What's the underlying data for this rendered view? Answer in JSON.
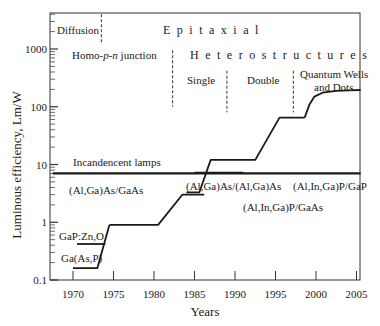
{
  "chart_data": {
    "type": "line",
    "title": "",
    "xlabel": "Years",
    "ylabel": "Luminous efficiency, Lm/W",
    "xlim": [
      1967,
      2006
    ],
    "ylim": [
      0.1,
      4000
    ],
    "yscale": "log",
    "grid": false,
    "x_ticks": [
      1970,
      1975,
      1980,
      1985,
      1990,
      1995,
      2000,
      2005
    ],
    "y_ticks": [
      0.1,
      1,
      10,
      100,
      1000
    ],
    "y_tick_labels": [
      "0.1",
      "1",
      "10",
      "100",
      "1000"
    ],
    "series": [
      {
        "name": "Ga(As,P)",
        "points": [
          [
            1970,
            0.16
          ],
          [
            1973,
            0.16
          ],
          [
            1974.5,
            0.9
          ]
        ]
      },
      {
        "name": "GaP:Zn,O",
        "points": [
          [
            1970.5,
            0.42
          ],
          [
            1974,
            0.42
          ]
        ]
      },
      {
        "name": "(Al,Ga)As/GaAs",
        "points": [
          [
            1974.5,
            0.9
          ],
          [
            1980.5,
            0.9
          ],
          [
            1983.5,
            3.0
          ],
          [
            1986.2,
            3.0
          ]
        ]
      },
      {
        "name": "(Al,Ga)As/(Al,Ga)As",
        "points": [
          [
            1984,
            3.3
          ],
          [
            1985.6,
            3.3
          ],
          [
            1987,
            12
          ],
          [
            1992.5,
            12
          ],
          [
            1995.5,
            65
          ],
          [
            1998.6,
            65
          ]
        ]
      },
      {
        "name": "(Al,In,Ga)P/GaAs & (Al,In,Ga)P/GaP",
        "points": [
          [
            1998.6,
            65
          ],
          [
            1999.2,
            110
          ],
          [
            1999.8,
            150
          ],
          [
            2000.8,
            175
          ],
          [
            2002.5,
            188
          ],
          [
            2004,
            193
          ],
          [
            2005.5,
            195
          ]
        ]
      },
      {
        "name": "Incandencent lamps",
        "points": [
          [
            1967.5,
            7.0
          ],
          [
            2005.5,
            7.0
          ]
        ]
      },
      {
        "name": "Incandescent overlap segment",
        "points": [
          [
            1985,
            7.2
          ],
          [
            1991,
            7.2
          ]
        ]
      }
    ],
    "annotations": [
      {
        "text": "Diffusion",
        "x": 1969.5,
        "y": 2300
      },
      {
        "text": "E p i t a x i a l",
        "x": 1985,
        "y": 2300
      },
      {
        "text": "Homo-p-n junction",
        "x": 1971,
        "y": 950
      },
      {
        "text": "H e t e r o s t r u c t u r e s",
        "x": 1985.5,
        "y": 950
      },
      {
        "text": "Single",
        "x": 1985,
        "y": 420
      },
      {
        "text": "Double",
        "x": 1992,
        "y": 420
      },
      {
        "text": "Quantum Wells",
        "x": 1997.8,
        "y": 400
      },
      {
        "text": "and Dots",
        "x": 1999.5,
        "y": 240
      },
      {
        "text": "Incandencent lamps",
        "x": 1970,
        "y": 9
      },
      {
        "text": "(Al,Ga)As/GaAs",
        "x": 1973.5,
        "y": 2.4
      },
      {
        "text": "(Al,Ga)As/(Al,Ga)As",
        "x": 1984.5,
        "y": 2.4
      },
      {
        "text": "(Al,In,Ga)P/GaAs",
        "x": 1992.5,
        "y": 1.5
      },
      {
        "text": "(Al,In,Ga)P/GaP",
        "x": 1998.5,
        "y": 2.4
      },
      {
        "text": "GaP:Zn,O",
        "x": 1968.2,
        "y": 0.5
      },
      {
        "text": "Ga(As,P)",
        "x": 1968.3,
        "y": 0.24
      }
    ],
    "dividers": [
      {
        "label": "Diffusion | Epitaxial",
        "x": 1973.5,
        "y_top": 4000,
        "y_bottom": 1200
      },
      {
        "label": "Homo | Hetero",
        "x": 1982.3,
        "y_top": 950,
        "y_bottom": 100
      },
      {
        "label": "Single | Double",
        "x": 1989,
        "y_top": 420,
        "y_bottom": 80
      },
      {
        "label": "Double | Quantum",
        "x": 1997.2,
        "y_top": 420,
        "y_bottom": 80
      }
    ]
  },
  "labels": {
    "diffusion": "Diffusion",
    "epitaxial": "Epitaxial",
    "homo_prefix": "Homo-",
    "homo_p": "p",
    "homo_dash": "-",
    "homo_n": "n",
    "homo_suffix": " junction",
    "heterostructures": "Heterostructures",
    "single": "Single",
    "double": "Double",
    "quantum_line1": "Quantum Wells",
    "quantum_line2": "and Dots",
    "incandescent": "Incandencent lamps",
    "algaas_gaas": "(Al,Ga)As/GaAs",
    "algaas_algaas": "(Al,Ga)As/(Al,Ga)As",
    "alinga_gaas": "(Al,In,Ga)P/GaAs",
    "alinga_gap": "(Al,In,Ga)P/GaP",
    "gap_zno": "GaP:Zn,O",
    "gaasp": "Ga(As,P)"
  },
  "colors": {
    "line": "#1a1a1a",
    "axis": "#333333",
    "background": "#ffffff"
  }
}
